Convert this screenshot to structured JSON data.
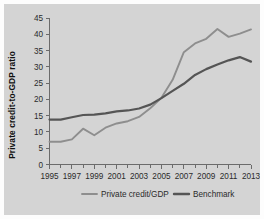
{
  "chart_data": {
    "type": "line",
    "title": "",
    "xlabel": "",
    "ylabel": "Private credit-to-GDP ratio",
    "xlim": [
      1995,
      2013
    ],
    "ylim": [
      0,
      45
    ],
    "grid": false,
    "legend_position": "bottom",
    "x": [
      1995,
      1996,
      1997,
      1998,
      1999,
      2000,
      2001,
      2002,
      2003,
      2004,
      2005,
      2006,
      2007,
      2008,
      2009,
      2010,
      2011,
      2012,
      2013
    ],
    "xticks": [
      1995,
      1997,
      1999,
      2001,
      2003,
      2005,
      2007,
      2009,
      2011,
      2013
    ],
    "xtick_labels": [
      "1995",
      "1997",
      "1999",
      "2001",
      "2003",
      "2005",
      "2007",
      "2009",
      "2011",
      "2013"
    ],
    "x_minor_ticks": [
      1996,
      1998,
      2000,
      2002,
      2004,
      2006,
      2008,
      2010,
      2012
    ],
    "yticks": [
      0,
      5,
      10,
      15,
      20,
      25,
      30,
      35,
      40,
      45
    ],
    "ytick_labels": [
      "0",
      "5",
      "10",
      "15",
      "20",
      "25",
      "30",
      "35",
      "40",
      "45"
    ],
    "series": [
      {
        "name": "Private credit/GDP",
        "color": "#8e8e8e",
        "linewidth": 1.9,
        "values": [
          7.0,
          7.0,
          7.7,
          11.0,
          9.0,
          11.3,
          12.6,
          13.3,
          14.6,
          17.3,
          20.5,
          26.0,
          34.5,
          37.2,
          38.6,
          41.6,
          39.2,
          40.2,
          41.5
        ]
      },
      {
        "name": "Benchmark",
        "color": "#555555",
        "linewidth": 2.2,
        "values": [
          13.8,
          13.8,
          14.5,
          15.2,
          15.3,
          15.7,
          16.3,
          16.6,
          17.2,
          18.4,
          20.4,
          22.6,
          24.8,
          27.5,
          29.3,
          30.7,
          32.0,
          33.0,
          31.6
        ]
      }
    ]
  },
  "legend": {
    "items": [
      {
        "label": "Private credit/GDP",
        "color": "#8e8e8e"
      },
      {
        "label": "Benchmark",
        "color": "#555555"
      }
    ]
  },
  "colors": {
    "panel_background": "#d4d4d4",
    "figure_background": "#fdfdfd",
    "axis": "#6b6b6b",
    "text": "#2b2b2b",
    "series_private_credit": "#8e8e8e",
    "series_benchmark": "#555555"
  }
}
